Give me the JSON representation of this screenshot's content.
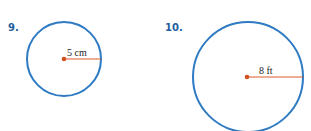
{
  "colors": {
    "number_label": "#1f5f9e",
    "circle_stroke": "#2e7bc4",
    "radius_line": "#e05a2a",
    "center_dot": "#d4501e"
  },
  "problems": [
    {
      "number": "9.",
      "radius_label": "5 cm",
      "figure": "circle"
    },
    {
      "number": "10.",
      "radius_label": "8 ft",
      "figure": "circle"
    }
  ]
}
